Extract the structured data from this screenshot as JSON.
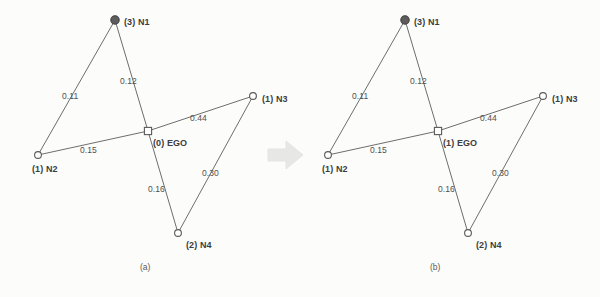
{
  "figure": {
    "type": "graph-transition-diagram",
    "panels": [
      {
        "id": "a",
        "caption": "(a)",
        "nodes": [
          {
            "id": "N1",
            "label": "(3) N1",
            "count": "3",
            "name": "N1",
            "shape": "filled-circle",
            "x": 115,
            "y": 20
          },
          {
            "id": "N2",
            "label": "(1) N2",
            "count": "1",
            "name": "N2",
            "shape": "open-circle",
            "x": 38,
            "y": 155
          },
          {
            "id": "N3",
            "label": "(1) N3",
            "count": "1",
            "name": "N3",
            "shape": "open-circle",
            "x": 253,
            "y": 96
          },
          {
            "id": "N4",
            "label": "(2) N4",
            "count": "2",
            "name": "N4",
            "shape": "open-circle",
            "x": 178,
            "y": 233
          },
          {
            "id": "EGO",
            "label": "(0) EGO",
            "count": "0",
            "name": "EGO",
            "shape": "square",
            "x": 148,
            "y": 131
          }
        ],
        "edges": [
          {
            "from": "N2",
            "to": "N1",
            "weight": "0.11",
            "lx": 62,
            "ly": 92
          },
          {
            "from": "N1",
            "to": "EGO",
            "weight": "0.12",
            "lx": 120,
            "ly": 77
          },
          {
            "from": "N2",
            "to": "EGO",
            "weight": "0.15",
            "lx": 80,
            "ly": 146
          },
          {
            "from": "EGO",
            "to": "N3",
            "weight": "0.44",
            "lx": 190,
            "ly": 114
          },
          {
            "from": "EGO",
            "to": "N4",
            "weight": "0.16",
            "lx": 148,
            "ly": 185
          },
          {
            "from": "N4",
            "to": "N3",
            "weight": "0.30",
            "lx": 202,
            "ly": 169
          }
        ]
      },
      {
        "id": "b",
        "caption": "(b)",
        "nodes": [
          {
            "id": "N1",
            "label": "(3) N1",
            "count": "3",
            "name": "N1",
            "shape": "filled-circle",
            "x": 115,
            "y": 20
          },
          {
            "id": "N2",
            "label": "(1) N2",
            "count": "1",
            "name": "N2",
            "shape": "open-circle",
            "x": 38,
            "y": 155
          },
          {
            "id": "N3",
            "label": "(1) N3",
            "count": "1",
            "name": "N3",
            "shape": "open-circle",
            "x": 253,
            "y": 96
          },
          {
            "id": "N4",
            "label": "(2) N4",
            "count": "2",
            "name": "N4",
            "shape": "open-circle",
            "x": 178,
            "y": 233
          },
          {
            "id": "EGO",
            "label": "(1) EGO",
            "count": "1",
            "name": "EGO",
            "shape": "square",
            "x": 148,
            "y": 131
          }
        ],
        "edges": [
          {
            "from": "N2",
            "to": "N1",
            "weight": "0.11",
            "lx": 62,
            "ly": 92
          },
          {
            "from": "N1",
            "to": "EGO",
            "weight": "0.12",
            "lx": 120,
            "ly": 77
          },
          {
            "from": "N2",
            "to": "EGO",
            "weight": "0.15",
            "lx": 80,
            "ly": 146
          },
          {
            "from": "EGO",
            "to": "N3",
            "weight": "0.44",
            "lx": 190,
            "ly": 114
          },
          {
            "from": "EGO",
            "to": "N4",
            "weight": "0.16",
            "lx": 148,
            "ly": 185
          },
          {
            "from": "N4",
            "to": "N3",
            "weight": "0.30",
            "lx": 202,
            "ly": 169
          }
        ]
      }
    ],
    "transition": {
      "icon": "right-arrow-icon",
      "direction": "right"
    },
    "colors": {
      "edge": "#6e6e6e",
      "node_stroke": "#5a5a5a",
      "node_fill_open": "#ffffff",
      "node_fill_active": "#5d5d5d",
      "text": "#3d3d3d",
      "arrow": "#b9b9b9",
      "background": "#fcfcfb"
    }
  }
}
